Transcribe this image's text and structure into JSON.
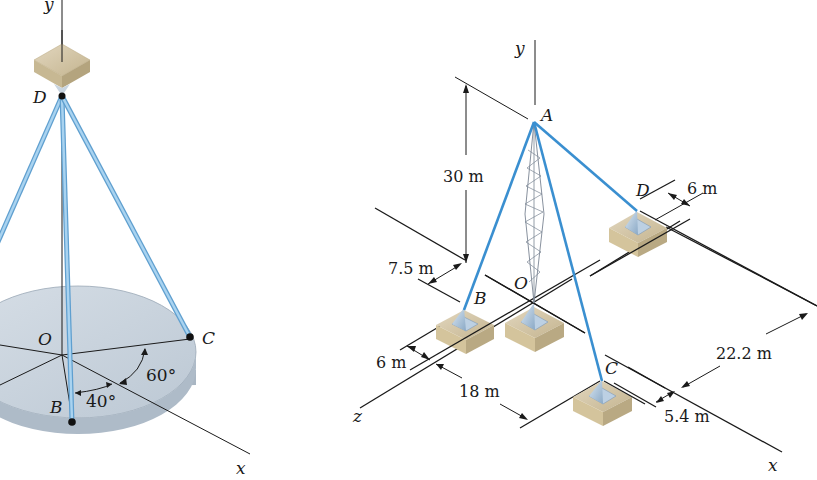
{
  "figure": {
    "left_panel": {
      "axes": {
        "y": "y",
        "x": "x"
      },
      "points": {
        "top": "D",
        "origin": "O",
        "b": "B",
        "c": "C"
      },
      "angles": {
        "angle_xc": "60°",
        "angle_bx": "40°"
      },
      "colors": {
        "cable": "#8fc3e6",
        "disc": "#c9d3dd",
        "block": "#cdbf9e"
      }
    },
    "right_panel": {
      "axes": {
        "y": "y",
        "x": "x",
        "z": "z"
      },
      "points": {
        "top": "A",
        "origin": "O",
        "b": "B",
        "c": "C",
        "d": "D"
      },
      "dimensions": {
        "height": "30 m",
        "b_offset": "7.5 m",
        "b_z_offset": "6 m",
        "c_z_distance": "18 m",
        "d_offset": "6 m",
        "c_x_distance": "22.2 m",
        "c_offset": "5.4 m"
      },
      "colors": {
        "cable": "#3a8fd0",
        "footing": "#d8c9a4",
        "pyramid": "#a9c2da"
      }
    }
  }
}
